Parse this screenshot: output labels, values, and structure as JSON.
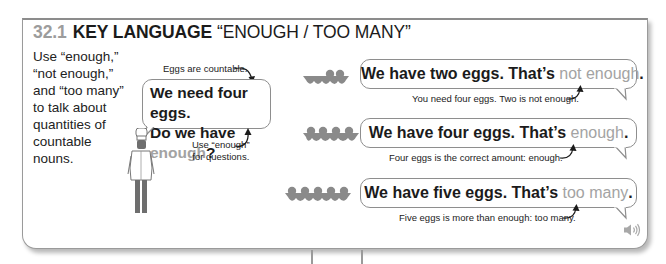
{
  "header": {
    "section_number": "32.1",
    "title_bold": "KEY LANGUAGE",
    "title_quote": "“ENOUGH / TOO MANY”"
  },
  "intro": {
    "text": "Use “enough,” “not enough,” and “too many” to talk about quantities of countable nouns."
  },
  "main_example": {
    "annotation_top": "Eggs are countable.",
    "line1": "We need four eggs.",
    "line2_prefix": "Do we have ",
    "line2_highlight": "enough",
    "line2_suffix": "?",
    "annotation_bottom_line1": "Use “enough”",
    "annotation_bottom_line2": "for questions.",
    "character_icon": "chef-icon"
  },
  "examples": [
    {
      "eggs": 2,
      "carton_icon": "egg-carton-two-icon",
      "sentence_prefix": "We have two eggs. That’s ",
      "highlight": "not enough",
      "sentence_suffix": ".",
      "explanation": "You need four eggs. Two is not enough."
    },
    {
      "eggs": 4,
      "carton_icon": "egg-carton-four-icon",
      "sentence_prefix": "We have four eggs. That’s ",
      "highlight": "enough",
      "sentence_suffix": ".",
      "explanation": "Four eggs is the correct amount: enough."
    },
    {
      "eggs": 5,
      "carton_icon": "egg-carton-five-icon",
      "sentence_prefix": "We have five eggs. That’s ",
      "highlight": "too many",
      "sentence_suffix": ".",
      "explanation": "Five eggs is more than enough: too many."
    }
  ],
  "audio": {
    "icon": "speaker-icon"
  },
  "colors": {
    "section_number": "#9c9c9c",
    "highlight": "#a3a3a3",
    "text": "#1b1b1b",
    "border": "#9a9a9a",
    "carton": "#8a8a8a"
  }
}
